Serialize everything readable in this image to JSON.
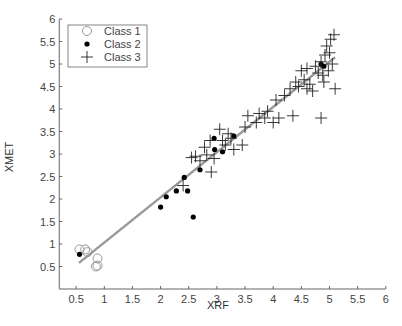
{
  "chart_data": {
    "type": "scatter",
    "title": "",
    "xlabel": "XRF",
    "ylabel": "XMET",
    "xlim": [
      0,
      6
    ],
    "ylim": [
      0,
      6
    ],
    "x_ticks": [
      "0.5",
      "1",
      "1.5",
      "2",
      "2.5",
      "3",
      "3.5",
      "4",
      "4.5",
      "5",
      "5.5",
      "6"
    ],
    "y_ticks": [
      "0.5",
      "1",
      "1.5",
      "2",
      "2.5",
      "3",
      "3.5",
      "4",
      "4.5",
      "5",
      "5.5",
      "6"
    ],
    "grid": false,
    "legend_position": "upper-left",
    "legend": [
      "Class 1",
      "Class 2",
      "Class 3"
    ],
    "series": [
      {
        "name": "Class 1",
        "marker": "open-circle",
        "points": [
          [
            0.56,
            0.88
          ],
          [
            0.66,
            0.88
          ],
          [
            0.7,
            0.82
          ],
          [
            0.88,
            0.68
          ],
          [
            0.85,
            0.5
          ],
          [
            0.88,
            0.52
          ]
        ]
      },
      {
        "name": "Class 2",
        "marker": "filled-dot",
        "points": [
          [
            0.56,
            0.77
          ],
          [
            2.0,
            1.82
          ],
          [
            2.1,
            2.05
          ],
          [
            2.28,
            2.18
          ],
          [
            2.42,
            2.48
          ],
          [
            2.48,
            2.18
          ],
          [
            2.58,
            1.6
          ],
          [
            2.7,
            2.65
          ],
          [
            2.95,
            3.35
          ],
          [
            2.96,
            3.1
          ],
          [
            3.1,
            3.05
          ],
          [
            3.3,
            3.4
          ],
          [
            4.9,
            4.95
          ],
          [
            4.85,
            5.0
          ]
        ]
      },
      {
        "name": "Class 3",
        "marker": "plus",
        "points": [
          [
            2.4,
            2.3
          ],
          [
            2.55,
            2.92
          ],
          [
            2.62,
            2.95
          ],
          [
            2.7,
            2.85
          ],
          [
            2.78,
            3.15
          ],
          [
            2.82,
            2.98
          ],
          [
            2.88,
            3.3
          ],
          [
            2.9,
            2.6
          ],
          [
            2.95,
            2.9
          ],
          [
            3.05,
            3.55
          ],
          [
            3.1,
            3.3
          ],
          [
            3.15,
            3.2
          ],
          [
            3.2,
            3.45
          ],
          [
            3.25,
            3.35
          ],
          [
            3.3,
            3.1
          ],
          [
            3.45,
            3.2
          ],
          [
            3.5,
            3.6
          ],
          [
            3.55,
            3.85
          ],
          [
            3.7,
            3.7
          ],
          [
            3.75,
            3.9
          ],
          [
            3.85,
            3.8
          ],
          [
            3.9,
            3.95
          ],
          [
            4.0,
            3.7
          ],
          [
            4.05,
            4.2
          ],
          [
            4.1,
            3.8
          ],
          [
            4.2,
            4.3
          ],
          [
            4.3,
            4.45
          ],
          [
            4.35,
            3.85
          ],
          [
            4.4,
            4.6
          ],
          [
            4.45,
            4.5
          ],
          [
            4.5,
            4.85
          ],
          [
            4.55,
            4.65
          ],
          [
            4.6,
            4.45
          ],
          [
            4.65,
            4.55
          ],
          [
            4.7,
            4.4
          ],
          [
            4.75,
            4.95
          ],
          [
            4.8,
            4.8
          ],
          [
            4.85,
            5.05
          ],
          [
            4.85,
            3.8
          ],
          [
            4.9,
            4.6
          ],
          [
            4.92,
            5.2
          ],
          [
            4.95,
            5.4
          ],
          [
            5.0,
            5.25
          ],
          [
            5.02,
            5.55
          ],
          [
            5.05,
            5.0
          ],
          [
            5.08,
            5.65
          ],
          [
            5.1,
            4.45
          ],
          [
            4.98,
            4.85
          ],
          [
            4.88,
            4.75
          ],
          [
            4.6,
            4.9
          ]
        ]
      }
    ],
    "fit_line": {
      "from": [
        0.55,
        0.58
      ],
      "to": [
        5.1,
        5.15
      ],
      "color": "#9a9a9a"
    }
  }
}
